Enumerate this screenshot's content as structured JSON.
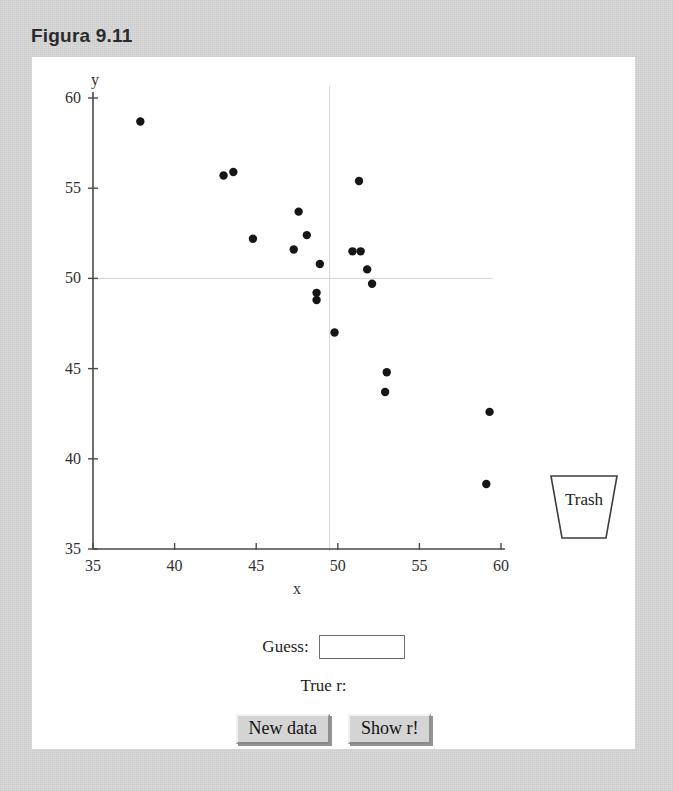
{
  "figure": {
    "title": "Figura 9.11"
  },
  "colors": {
    "page_background": "#c2c2c2",
    "panel_background": "#ffffff",
    "axis": "#4a4a4a",
    "point": "#161616",
    "reference_line": "#d6d6d6",
    "button_face": "#d4d4d4"
  },
  "chart_data": {
    "type": "scatter",
    "title": "",
    "xlabel": "x",
    "ylabel": "y",
    "xlim": [
      35,
      60
    ],
    "ylim": [
      35,
      60
    ],
    "xticks": [
      35,
      40,
      45,
      50,
      55,
      60
    ],
    "yticks": [
      35,
      40,
      45,
      50,
      55,
      60
    ],
    "grid": false,
    "reference_lines": {
      "vertical_x": 49.5,
      "horizontal_y": 50.0
    },
    "legend": null,
    "series": [
      {
        "name": "points",
        "marker": "filled-circle",
        "points": [
          [
            37.9,
            58.7
          ],
          [
            43.0,
            55.7
          ],
          [
            43.6,
            55.9
          ],
          [
            51.3,
            55.4
          ],
          [
            47.6,
            53.7
          ],
          [
            44.8,
            52.2
          ],
          [
            48.1,
            52.4
          ],
          [
            47.3,
            51.6
          ],
          [
            50.9,
            51.5
          ],
          [
            51.4,
            51.5
          ],
          [
            48.9,
            50.8
          ],
          [
            51.8,
            50.5
          ],
          [
            52.1,
            49.7
          ],
          [
            48.7,
            49.2
          ],
          [
            48.7,
            48.8
          ],
          [
            49.8,
            47.0
          ],
          [
            53.0,
            44.8
          ],
          [
            52.9,
            43.7
          ],
          [
            59.3,
            42.6
          ],
          [
            59.1,
            38.6
          ]
        ]
      }
    ]
  },
  "trash": {
    "label": "Trash"
  },
  "controls": {
    "guess_label": "Guess:",
    "guess_value": "",
    "guess_placeholder": "",
    "true_r_label": "True r:",
    "true_r_value": "",
    "new_data_label": "New data",
    "show_r_label": "Show r!"
  }
}
